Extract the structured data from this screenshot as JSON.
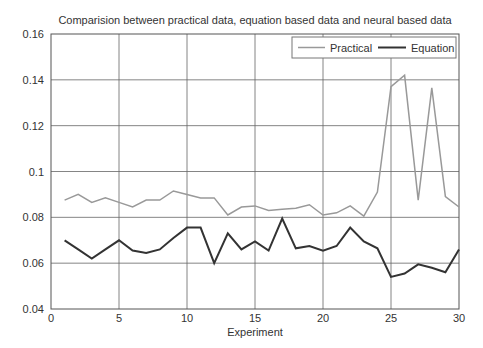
{
  "chart_data": {
    "type": "line",
    "title": "Comparision between practical data, equation based data and neural based data",
    "xlabel": "Experiment",
    "ylabel": "",
    "xlim": [
      0,
      30
    ],
    "ylim": [
      0.04,
      0.16
    ],
    "x_ticks": [
      0,
      5,
      10,
      15,
      20,
      25,
      30
    ],
    "x_tick_labels": [
      "0",
      "5",
      "10",
      "15",
      "20",
      "25",
      "30"
    ],
    "y_ticks": [
      0.04,
      0.06,
      0.08,
      0.1,
      0.12,
      0.14,
      0.16
    ],
    "y_tick_labels": [
      "0.04",
      "0.06",
      "0.08",
      "0.1",
      "0.12",
      "0.14",
      "0.16"
    ],
    "grid": true,
    "legend_position": "top-right",
    "x": [
      1,
      2,
      3,
      4,
      5,
      6,
      7,
      8,
      9,
      10,
      11,
      12,
      13,
      14,
      15,
      16,
      17,
      18,
      19,
      20,
      21,
      22,
      23,
      24,
      25,
      26,
      27,
      28,
      29,
      30
    ],
    "series": [
      {
        "name": "Practical",
        "color": "#999999",
        "values": [
          0.0875,
          0.09,
          0.0865,
          0.0885,
          0.0865,
          0.0845,
          0.0875,
          0.0875,
          0.0915,
          0.09,
          0.0885,
          0.0885,
          0.081,
          0.0845,
          0.085,
          0.083,
          0.0835,
          0.084,
          0.0855,
          0.081,
          0.082,
          0.085,
          0.0805,
          0.091,
          0.137,
          0.142,
          0.0875,
          0.1365,
          0.089,
          0.0845
        ]
      },
      {
        "name": "Equation",
        "color": "#333333",
        "values": [
          0.07,
          0.066,
          0.062,
          0.066,
          0.07,
          0.0655,
          0.0645,
          0.066,
          0.071,
          0.0755,
          0.0755,
          0.06,
          0.073,
          0.066,
          0.0695,
          0.0655,
          0.0795,
          0.0665,
          0.0675,
          0.0655,
          0.0675,
          0.0755,
          0.0695,
          0.0665,
          0.054,
          0.0555,
          0.0595,
          0.058,
          0.056,
          0.066
        ]
      }
    ]
  }
}
